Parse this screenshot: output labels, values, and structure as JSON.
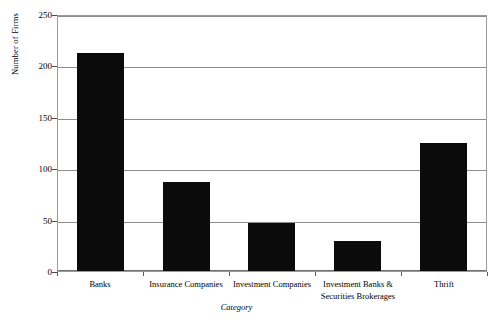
{
  "chart_data": {
    "type": "bar",
    "title": "",
    "xlabel": "Category",
    "ylabel": "Number of Firms",
    "categories": [
      "Banks",
      "Insurance Companies",
      "Investment Companies",
      "Investment Banks  &\nSecurities Brokerages",
      "Thrift"
    ],
    "values": [
      212,
      87,
      47,
      29,
      125
    ],
    "ylim": [
      0,
      250
    ],
    "yticks": [
      0,
      50,
      100,
      150,
      200,
      250
    ],
    "ytick_labels": [
      "0",
      "50",
      "100",
      "150",
      "200",
      "250"
    ],
    "grid": true,
    "legend": false,
    "bar_color": "#0b0b0b",
    "gridline_color": "#8d8d8d",
    "frame_color": "#9a9a9a",
    "background": "#ffffff"
  }
}
